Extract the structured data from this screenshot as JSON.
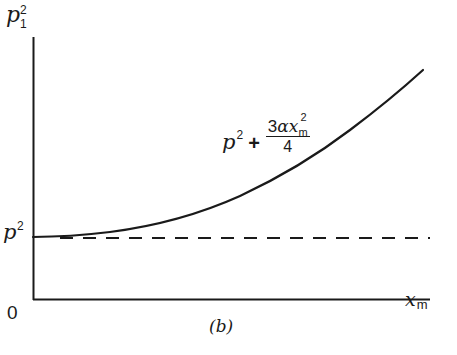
{
  "figure": {
    "caption": "(b)",
    "y_axis": {
      "label_base": "p",
      "label_superscript": "2",
      "label_subscript": "1"
    },
    "x_axis": {
      "label_base": "x",
      "label_subscript": "m"
    },
    "origin_label": "0",
    "reference_level": {
      "label_base": "p",
      "label_superscript": "2",
      "style": "dashed"
    },
    "curve": {
      "label_term1_base": "p",
      "label_term1_superscript": "2",
      "label_plus": "+",
      "label_numerator_coef": "3",
      "label_numerator_alpha": "α",
      "label_numerator_x": "x",
      "label_numerator_sup": "2",
      "label_numerator_sub": "m",
      "label_denominator": "4",
      "style": "solid",
      "shape": "parabola rising from p² at x_m = 0"
    },
    "colors": {
      "ink": "#1a1a1a",
      "background": "#ffffff"
    }
  }
}
